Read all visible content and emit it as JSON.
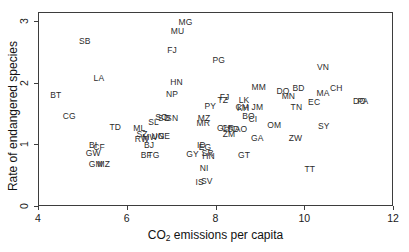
{
  "chart_data": {
    "type": "scatter",
    "title": "",
    "xlabel": "CO2 emissions per capita",
    "xlabel_main": "CO",
    "xlabel_sub": "2",
    "xlabel_rest": " emissions per capita",
    "ylabel": "Rate of endangered species",
    "xlim": [
      4,
      12
    ],
    "ylim": [
      0,
      3.15
    ],
    "xticks": [
      4,
      6,
      8,
      10,
      12
    ],
    "yticks": [
      0,
      1,
      2,
      3
    ],
    "grid": false,
    "legend": null,
    "marker": "text-label",
    "points": [
      {
        "label": "MG",
        "x": 7.3,
        "y": 3.01
      },
      {
        "label": "MU",
        "x": 7.12,
        "y": 2.85
      },
      {
        "label": "SB",
        "x": 5.03,
        "y": 2.7
      },
      {
        "label": "FJ",
        "x": 7.0,
        "y": 2.55
      },
      {
        "label": "PG",
        "x": 8.05,
        "y": 2.38
      },
      {
        "label": "VN",
        "x": 10.4,
        "y": 2.28
      },
      {
        "label": "LA",
        "x": 5.35,
        "y": 2.09
      },
      {
        "label": "HN",
        "x": 7.1,
        "y": 2.03
      },
      {
        "label": "MM",
        "x": 8.95,
        "y": 1.95
      },
      {
        "label": "BD",
        "x": 9.85,
        "y": 1.94
      },
      {
        "label": "CH",
        "x": 10.7,
        "y": 1.93
      },
      {
        "label": "BT",
        "x": 4.38,
        "y": 1.82
      },
      {
        "label": "NP",
        "x": 7.0,
        "y": 1.84
      },
      {
        "label": "DO",
        "x": 9.5,
        "y": 1.88
      },
      {
        "label": "MA",
        "x": 10.4,
        "y": 1.85
      },
      {
        "label": "MN",
        "x": 9.62,
        "y": 1.81
      },
      {
        "label": "FJ2",
        "x": 8.18,
        "y": 1.79
      },
      {
        "label": "TZ",
        "x": 8.14,
        "y": 1.74
      },
      {
        "label": "LK",
        "x": 8.62,
        "y": 1.74
      },
      {
        "label": "DO2",
        "x": 11.22,
        "y": 1.72
      },
      {
        "label": "PA",
        "x": 11.3,
        "y": 1.72
      },
      {
        "label": "EC",
        "x": 10.2,
        "y": 1.7
      },
      {
        "label": "CM",
        "x": 8.58,
        "y": 1.63
      },
      {
        "label": "KH",
        "x": 8.6,
        "y": 1.6
      },
      {
        "label": "PY",
        "x": 7.86,
        "y": 1.64
      },
      {
        "label": "JM",
        "x": 8.92,
        "y": 1.62
      },
      {
        "label": "TN",
        "x": 9.8,
        "y": 1.62
      },
      {
        "label": "CG",
        "x": 4.68,
        "y": 1.47
      },
      {
        "label": "SO",
        "x": 6.76,
        "y": 1.46
      },
      {
        "label": "SD",
        "x": 6.82,
        "y": 1.45
      },
      {
        "label": "SN",
        "x": 7.0,
        "y": 1.45
      },
      {
        "label": "MZ",
        "x": 7.72,
        "y": 1.45
      },
      {
        "label": "BO",
        "x": 8.72,
        "y": 1.47
      },
      {
        "label": "CI",
        "x": 8.82,
        "y": 1.43
      },
      {
        "label": "SL",
        "x": 6.58,
        "y": 1.38
      },
      {
        "label": "MR",
        "x": 7.7,
        "y": 1.36
      },
      {
        "label": "TD",
        "x": 5.72,
        "y": 1.3
      },
      {
        "label": "ML",
        "x": 6.26,
        "y": 1.28
      },
      {
        "label": "GH",
        "x": 8.16,
        "y": 1.29
      },
      {
        "label": "CR",
        "x": 8.26,
        "y": 1.28
      },
      {
        "label": "SD2",
        "x": 8.38,
        "y": 1.26
      },
      {
        "label": "AO",
        "x": 8.55,
        "y": 1.26
      },
      {
        "label": "OM",
        "x": 9.3,
        "y": 1.33
      },
      {
        "label": "SY",
        "x": 10.42,
        "y": 1.32
      },
      {
        "label": "SZ",
        "x": 6.32,
        "y": 1.18
      },
      {
        "label": "ZM",
        "x": 8.28,
        "y": 1.18
      },
      {
        "label": "MW",
        "x": 6.5,
        "y": 1.14
      },
      {
        "label": "UG",
        "x": 6.68,
        "y": 1.16
      },
      {
        "label": "NE",
        "x": 6.82,
        "y": 1.16
      },
      {
        "label": "RW",
        "x": 6.32,
        "y": 1.1
      },
      {
        "label": "GA",
        "x": 8.92,
        "y": 1.12
      },
      {
        "label": "ZW",
        "x": 9.78,
        "y": 1.12
      },
      {
        "label": "BI",
        "x": 5.22,
        "y": 1.0
      },
      {
        "label": "CF",
        "x": 5.35,
        "y": 0.98
      },
      {
        "label": "BJ",
        "x": 6.48,
        "y": 1.01
      },
      {
        "label": "ID",
        "x": 7.66,
        "y": 1.0
      },
      {
        "label": "EG",
        "x": 7.74,
        "y": 0.98
      },
      {
        "label": "GW",
        "x": 5.22,
        "y": 0.88
      },
      {
        "label": "BF",
        "x": 6.42,
        "y": 0.84
      },
      {
        "label": "TG",
        "x": 6.58,
        "y": 0.84
      },
      {
        "label": "GY",
        "x": 7.46,
        "y": 0.86
      },
      {
        "label": "SR",
        "x": 7.8,
        "y": 0.87
      },
      {
        "label": "HN2",
        "x": 7.82,
        "y": 0.83
      },
      {
        "label": "GT",
        "x": 8.62,
        "y": 0.84
      },
      {
        "label": "GM",
        "x": 5.28,
        "y": 0.7
      },
      {
        "label": "MZ2",
        "x": 5.46,
        "y": 0.7
      },
      {
        "label": "NI",
        "x": 7.72,
        "y": 0.63
      },
      {
        "label": "TT",
        "x": 10.1,
        "y": 0.62
      },
      {
        "label": "IS",
        "x": 7.62,
        "y": 0.4
      },
      {
        "label": "SV",
        "x": 7.78,
        "y": 0.42
      }
    ]
  },
  "axes": {
    "x_tick_labels": [
      "4",
      "6",
      "8",
      "10",
      "12"
    ],
    "y_tick_labels": [
      "0",
      "1",
      "2",
      "3"
    ]
  }
}
